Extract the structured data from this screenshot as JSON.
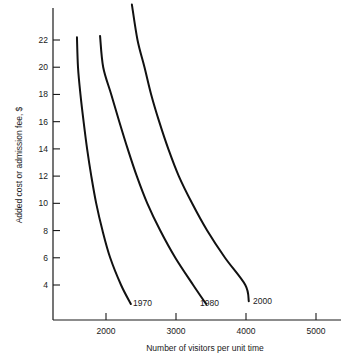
{
  "chart_data": {
    "type": "line",
    "title": "",
    "xlabel": "Number of visitors per unit time",
    "ylabel": "Added cost or admission fee, $",
    "xlim": [
      1300,
      5500
    ],
    "ylim": [
      2.0,
      24.6
    ],
    "grid": false,
    "legend_position": "inline-end-of-curve",
    "xticks": [
      2000,
      3000,
      4000,
      5000
    ],
    "xtick_labels": [
      "2000",
      "3000",
      "4000",
      "5000"
    ],
    "yticks": [
      4,
      6,
      8,
      10,
      12,
      14,
      16,
      18,
      20,
      22
    ],
    "ytick_labels": [
      "4",
      "6",
      "8",
      "10",
      "12",
      "14",
      "16",
      "18",
      "20",
      "22"
    ],
    "series": [
      {
        "name": "1970",
        "label": "1970",
        "color": "#111111",
        "points": [
          [
            1585,
            22.2
          ],
          [
            1600,
            20.0
          ],
          [
            1635,
            18.0
          ],
          [
            1680,
            16.0
          ],
          [
            1730,
            14.0
          ],
          [
            1790,
            12.0
          ],
          [
            1860,
            10.0
          ],
          [
            1950,
            8.0
          ],
          [
            2060,
            6.0
          ],
          [
            2215,
            4.0
          ],
          [
            2355,
            2.6
          ]
        ]
      },
      {
        "name": "1980",
        "label": "1980",
        "color": "#111111",
        "points": [
          [
            1915,
            22.3
          ],
          [
            1960,
            20.0
          ],
          [
            2075,
            18.0
          ],
          [
            2190,
            16.0
          ],
          [
            2310,
            14.0
          ],
          [
            2440,
            12.0
          ],
          [
            2590,
            10.0
          ],
          [
            2775,
            8.0
          ],
          [
            2990,
            6.0
          ],
          [
            3245,
            4.0
          ],
          [
            3430,
            2.6
          ]
        ]
      },
      {
        "name": "2000",
        "label": "2000",
        "color": "#111111",
        "points": [
          [
            2370,
            24.6
          ],
          [
            2450,
            22.0
          ],
          [
            2550,
            20.0
          ],
          [
            2645,
            18.0
          ],
          [
            2760,
            16.0
          ],
          [
            2890,
            14.0
          ],
          [
            3040,
            12.0
          ],
          [
            3230,
            10.0
          ],
          [
            3445,
            8.0
          ],
          [
            3700,
            6.0
          ],
          [
            3990,
            4.0
          ],
          [
            4040,
            2.8
          ]
        ]
      }
    ],
    "annotations": [
      {
        "text": "1970",
        "x_px": 133,
        "y_px": 306
      },
      {
        "text": "1980",
        "x_px": 200,
        "y_px": 306
      },
      {
        "text": "2000",
        "x_px": 253,
        "y_px": 304
      }
    ]
  },
  "axis": {
    "y_title": "Added cost or admission fee, $",
    "x_title": "Number of visitors per unit time"
  },
  "colors": {
    "background": "#ffffff",
    "ink": "#1a1a1a",
    "curve": "#111111"
  }
}
